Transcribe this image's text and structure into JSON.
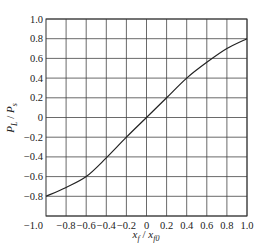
{
  "chart_data": {
    "type": "line",
    "title": "",
    "xlabel": "x_f / x_f0",
    "ylabel": "P_L / P_s",
    "xlabel_parts": {
      "main": "x",
      "sub": "f",
      "sep": " / ",
      "main2": "x",
      "sub2": "f0"
    },
    "ylabel_parts": {
      "main": "P",
      "sub": "L",
      "sep": " / ",
      "main2": "P",
      "sub2": "s"
    },
    "xlim": [
      -1.0,
      1.0
    ],
    "ylim": [
      -1.0,
      1.0
    ],
    "grid": true,
    "xticks": [
      "-0.8",
      "-0.6",
      "-0.4",
      "-0.2",
      "0",
      "0.2",
      "0.4",
      "0.6",
      "0.8",
      "1.0"
    ],
    "xtick_values": [
      -0.8,
      -0.6,
      -0.4,
      -0.2,
      0,
      0.2,
      0.4,
      0.6,
      0.8,
      1.0
    ],
    "yticks": [
      "-1.0",
      "-0.8",
      "-0.6",
      "-0.4",
      "-0.2",
      "0",
      "0.2",
      "0.4",
      "0.6",
      "0.8",
      "1.0"
    ],
    "ytick_values": [
      -1.0,
      -0.8,
      -0.6,
      -0.4,
      -0.2,
      0,
      0.2,
      0.4,
      0.6,
      0.8,
      1.0
    ],
    "series": [
      {
        "name": "P_L/P_s",
        "x": [
          -1.0,
          -0.8,
          -0.6,
          -0.4,
          -0.2,
          0.0,
          0.2,
          0.4,
          0.6,
          0.8,
          1.0
        ],
        "y": [
          -0.8,
          -0.71,
          -0.6,
          -0.41,
          -0.2,
          0.0,
          0.2,
          0.4,
          0.56,
          0.7,
          0.8
        ]
      }
    ]
  }
}
